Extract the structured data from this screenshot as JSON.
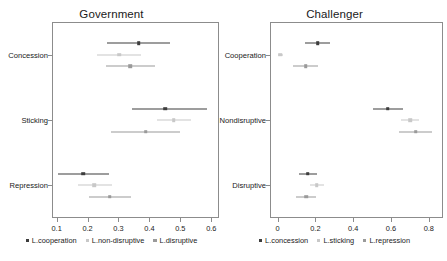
{
  "chart_data": [
    {
      "type": "scatter",
      "title": "Government",
      "xlabel": "",
      "ylabel": "",
      "xlim": [
        0.085,
        0.625
      ],
      "ylim": [
        0,
        3
      ],
      "grid": false,
      "legend_position": "bottom",
      "orientation": "horizontal",
      "error_bars": "confidence-interval",
      "categories": [
        "Concession",
        "Sticking",
        "Repression"
      ],
      "xticks": [
        "0.1",
        "0.2",
        "0.3",
        "0.4",
        "0.5",
        "0.6"
      ],
      "xtick_values": [
        0.1,
        0.2,
        0.3,
        0.4,
        0.5,
        0.6
      ],
      "series": [
        {
          "name": "L.cooperation",
          "color": "#3d3d3d",
          "values": [
            0.365,
            0.452,
            0.185
          ],
          "ci_low": [
            0.263,
            0.345,
            0.103
          ],
          "ci_high": [
            0.467,
            0.585,
            0.268
          ]
        },
        {
          "name": "L.non-disruptive",
          "color": "#c8c8c8",
          "values": [
            0.302,
            0.478,
            0.222
          ],
          "ci_low": [
            0.232,
            0.423,
            0.168
          ],
          "ci_high": [
            0.372,
            0.533,
            0.278
          ]
        },
        {
          "name": "L.disruptive",
          "color": "#9a9a9a",
          "values": [
            0.337,
            0.388,
            0.272
          ],
          "ci_low": [
            0.259,
            0.277,
            0.205
          ],
          "ci_high": [
            0.419,
            0.5,
            0.34
          ]
        }
      ]
    },
    {
      "type": "scatter",
      "title": "Challenger",
      "xlabel": "",
      "ylabel": "",
      "xlim": [
        -0.04,
        0.875
      ],
      "ylim": [
        0,
        3
      ],
      "grid": false,
      "legend_position": "bottom",
      "orientation": "horizontal",
      "error_bars": "confidence-interval",
      "categories": [
        "Cooperation",
        "Nondisruptive",
        "Disruptive"
      ],
      "xticks": [
        "0",
        "0.2",
        "0.4",
        "0.6",
        "0.8"
      ],
      "xtick_values": [
        0,
        0.2,
        0.4,
        0.6,
        0.8
      ],
      "series": [
        {
          "name": "L.concession",
          "color": "#3d3d3d",
          "values": [
            0.212,
            0.583,
            0.16
          ],
          "ci_low": [
            0.147,
            0.505,
            0.113
          ],
          "ci_high": [
            0.28,
            0.662,
            0.208
          ]
        },
        {
          "name": "L.sticking",
          "color": "#c8c8c8",
          "values": [
            0.015,
            0.7,
            0.207
          ],
          "ci_low": [
            0.004,
            0.655,
            0.172
          ],
          "ci_high": [
            0.028,
            0.75,
            0.243
          ]
        },
        {
          "name": "L.repression",
          "color": "#9a9a9a",
          "values": [
            0.148,
            0.73,
            0.152
          ],
          "ci_low": [
            0.082,
            0.64,
            0.1
          ],
          "ci_high": [
            0.215,
            0.818,
            0.205
          ]
        }
      ]
    }
  ]
}
